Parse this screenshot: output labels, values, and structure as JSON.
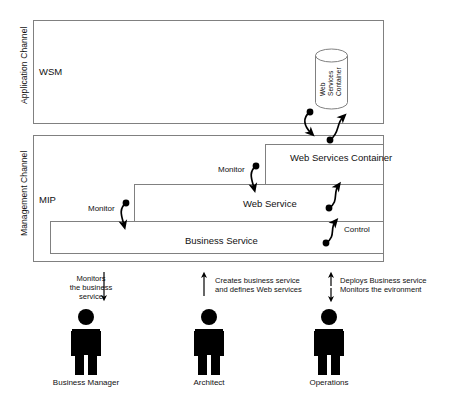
{
  "diagram": {
    "channels": [
      {
        "id": "application",
        "vertical_label": "Application Channel",
        "inner_label": "WSM"
      },
      {
        "id": "management",
        "vertical_label": "Management Channel",
        "inner_label": "MIP"
      }
    ],
    "cylinder": {
      "label_lines": [
        "Web",
        "Services",
        "Container"
      ]
    },
    "nested_boxes": [
      {
        "id": "web-services-container",
        "label": "Web Services Container"
      },
      {
        "id": "web-service",
        "label": "Web Service"
      },
      {
        "id": "business-service",
        "label": "Business Service"
      }
    ],
    "relation_labels": [
      {
        "id": "monitor-web-service",
        "label": "Monitor"
      },
      {
        "id": "monitor-business-service",
        "label": "Monitor"
      },
      {
        "id": "control",
        "label": "Control"
      }
    ],
    "actors": [
      {
        "id": "business-manager",
        "name": "Business Manager",
        "note_lines": [
          "Monitors",
          "the business",
          "service"
        ],
        "arrow_direction": "down"
      },
      {
        "id": "architect",
        "name": "Architect",
        "note_lines": [
          "Creates business service",
          "and defines Web services"
        ],
        "arrow_direction": "up"
      },
      {
        "id": "operations",
        "name": "Operations",
        "note_lines": [
          "Deploys Business service",
          "Monitors the evironment"
        ],
        "arrow_direction": "both"
      }
    ],
    "colors": {
      "box_stroke": "#808080",
      "arrow": "#000000",
      "figure": "#000000",
      "text": "#111111",
      "background": "#ffffff"
    }
  }
}
